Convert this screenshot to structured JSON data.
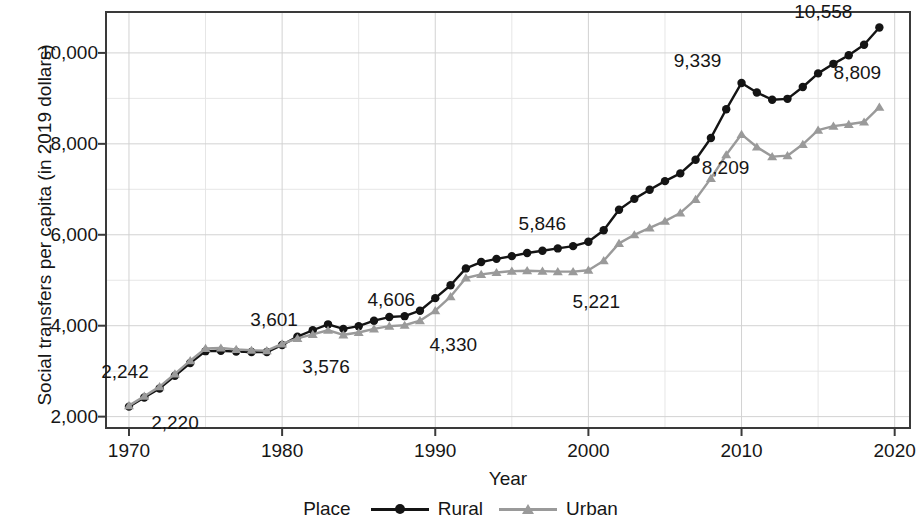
{
  "chart_data": {
    "type": "line",
    "title": "",
    "xlabel": "Year",
    "ylabel": "Social transfers per capita (in 2019 dollars)",
    "xlim": [
      1968.5,
      2021.0
    ],
    "ylim": [
      1750,
      10900
    ],
    "xticks": [
      1970,
      1980,
      1990,
      2000,
      2010,
      2020
    ],
    "xtick_labels": [
      "1970",
      "1980",
      "1990",
      "2000",
      "2010",
      "2020"
    ],
    "yticks": [
      2000,
      4000,
      6000,
      8000,
      10000
    ],
    "ytick_labels": [
      "2,000",
      "4,000",
      "6,000",
      "8,000",
      "10,000"
    ],
    "grid": true,
    "grid_minor_y": [
      3000,
      5000,
      7000,
      9000
    ],
    "grid_minor_x": [
      1975,
      1985,
      1995,
      2005,
      2015
    ],
    "legend_position": "bottom",
    "legend_title": "Place",
    "x": [
      1970,
      1971,
      1972,
      1973,
      1974,
      1975,
      1976,
      1977,
      1978,
      1979,
      1980,
      1981,
      1982,
      1983,
      1984,
      1985,
      1986,
      1987,
      1988,
      1989,
      1990,
      1991,
      1992,
      1993,
      1994,
      1995,
      1996,
      1997,
      1998,
      1999,
      2000,
      2001,
      2002,
      2003,
      2004,
      2005,
      2006,
      2007,
      2008,
      2009,
      2010,
      2011,
      2012,
      2013,
      2014,
      2015,
      2016,
      2017,
      2018,
      2019
    ],
    "series": [
      {
        "name": "Rural",
        "color": "#141414",
        "marker": "circle",
        "values": [
          2220,
          2420,
          2620,
          2900,
          3180,
          3440,
          3450,
          3430,
          3420,
          3420,
          3576,
          3760,
          3900,
          4030,
          3930,
          3990,
          4110,
          4190,
          4210,
          4330,
          4606,
          4890,
          5260,
          5400,
          5470,
          5530,
          5600,
          5650,
          5700,
          5750,
          5846,
          6100,
          6550,
          6790,
          6990,
          7180,
          7350,
          7650,
          8130,
          8760,
          9339,
          9130,
          8970,
          8990,
          9250,
          9550,
          9760,
          9950,
          10180,
          10558
        ]
      },
      {
        "name": "Urban",
        "color": "#9a9a9a",
        "marker": "triangle",
        "values": [
          2242,
          2450,
          2660,
          2940,
          3230,
          3500,
          3510,
          3480,
          3460,
          3450,
          3601,
          3720,
          3810,
          3900,
          3800,
          3850,
          3930,
          3990,
          4010,
          4110,
          4330,
          4640,
          5050,
          5130,
          5170,
          5200,
          5210,
          5200,
          5190,
          5190,
          5221,
          5430,
          5810,
          6000,
          6150,
          6300,
          6480,
          6780,
          7240,
          7760,
          8209,
          7930,
          7720,
          7740,
          7990,
          8300,
          8390,
          8430,
          8480,
          8809
        ]
      }
    ],
    "annotations": [
      {
        "label": "2,242",
        "series": "Urban",
        "year": 1970,
        "value": 2242,
        "dx": -4,
        "dy": -34
      },
      {
        "label": "2,220",
        "series": "Rural",
        "year": 1970,
        "value": 2220,
        "dx": 46,
        "dy": 16
      },
      {
        "label": "3,601",
        "series": "Urban",
        "year": 1980,
        "value": 3601,
        "dx": -8,
        "dy": -24
      },
      {
        "label": "3,576",
        "series": "Rural",
        "year": 1980,
        "value": 3576,
        "dx": 44,
        "dy": 22
      },
      {
        "label": "4,606",
        "series": "Rural",
        "year": 1990,
        "value": 4606,
        "dx": -44,
        "dy": 2
      },
      {
        "label": "4,330",
        "series": "Urban",
        "year": 1990,
        "value": 4330,
        "dx": 18,
        "dy": 34
      },
      {
        "label": "5,846",
        "series": "Rural",
        "year": 2000,
        "value": 5846,
        "dx": -46,
        "dy": -18
      },
      {
        "label": "5,221",
        "series": "Urban",
        "year": 2000,
        "value": 5221,
        "dx": 8,
        "dy": 32
      },
      {
        "label": "9,339",
        "series": "Rural",
        "year": 2010,
        "value": 9339,
        "dx": -44,
        "dy": -22
      },
      {
        "label": "8,209",
        "series": "Urban",
        "year": 2010,
        "value": 8209,
        "dx": -16,
        "dy": 34
      },
      {
        "label": "10,558",
        "series": "Rural",
        "year": 2019,
        "value": 10558,
        "dx": -56,
        "dy": -16
      },
      {
        "label": "8,809",
        "series": "Urban",
        "year": 2019,
        "value": 8809,
        "dx": -22,
        "dy": -34
      }
    ]
  }
}
